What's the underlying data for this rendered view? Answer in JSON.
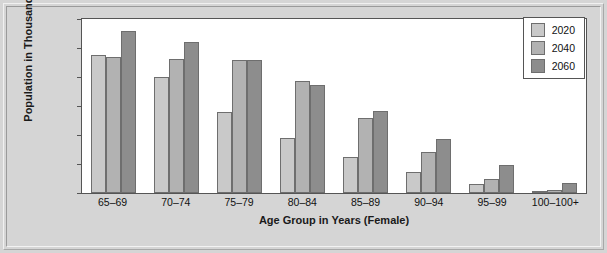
{
  "chart_data": {
    "type": "bar",
    "title": "",
    "xlabel": "Age Group in Years (Female)",
    "ylabel": "Population in Thousands",
    "ylim": [
      0,
      12000
    ],
    "yticks": [
      0,
      2000,
      4000,
      6000,
      8000,
      10000,
      12000
    ],
    "ytick_labels": [
      "0",
      "2,000",
      "4,000",
      "6,000",
      "8,000",
      "10,000",
      "12,000"
    ],
    "grid": false,
    "legend_position": "top-right",
    "categories": [
      "65–69",
      "70–74",
      "75–79",
      "80–84",
      "85–89",
      "90–94",
      "95–99",
      "100–100+"
    ],
    "series": [
      {
        "name": "2020",
        "color": "#c9c9c9",
        "values": [
          9500,
          8000,
          5600,
          3800,
          2500,
          1450,
          600,
          90
        ]
      },
      {
        "name": "2040",
        "color": "#b2b2b2",
        "values": [
          9400,
          9250,
          9150,
          7750,
          5200,
          2800,
          950,
          200
        ]
      },
      {
        "name": "2060",
        "color": "#8d8d8d",
        "values": [
          11150,
          10400,
          9200,
          7450,
          5650,
          3700,
          1900,
          700
        ]
      }
    ]
  },
  "colors": {
    "background": "#d5d5d5",
    "plot_background": "#ffffff",
    "axis": "#555555",
    "text": "#111111"
  }
}
